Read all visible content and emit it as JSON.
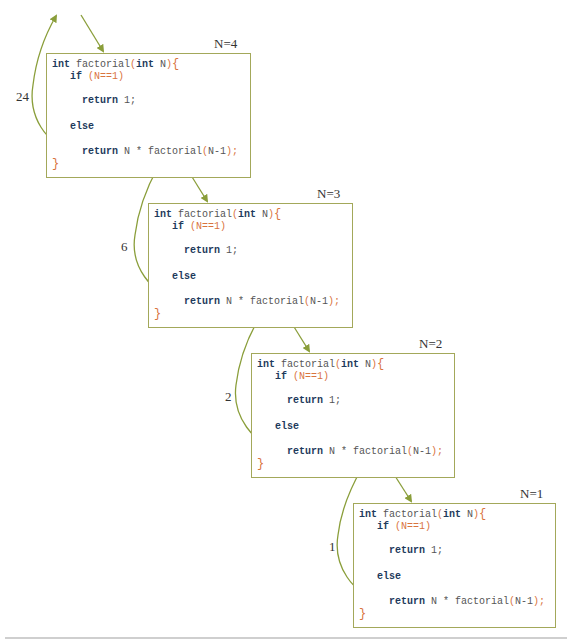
{
  "diagram": {
    "title": "",
    "frames": [
      {
        "label": "N=4",
        "return_value": "24",
        "code": {
          "kw_int1": "int",
          "fname": " factorial",
          "lp": "(",
          "kw_int2": "int",
          "param": " N",
          "rp": ")",
          "lbrace": "{",
          "kw_if": "if",
          "cond_open": " (",
          "cond": "N==1",
          "cond_close": ")",
          "kw_return1": "return",
          "ret1_val": " 1;",
          "kw_else": "else",
          "kw_return2": "return",
          "ret2_expr": " N * factorial",
          "call_open": "(",
          "call_arg": "N-1",
          "call_close": ")",
          "semi": ";",
          "rbrace": "}"
        }
      },
      {
        "label": "N=3",
        "return_value": "6",
        "code": {
          "kw_int1": "int",
          "fname": " factorial",
          "lp": "(",
          "kw_int2": "int",
          "param": " N",
          "rp": ")",
          "lbrace": "{",
          "kw_if": "if",
          "cond_open": " (",
          "cond": "N==1",
          "cond_close": ")",
          "kw_return1": "return",
          "ret1_val": " 1;",
          "kw_else": "else",
          "kw_return2": "return",
          "ret2_expr": " N * factorial",
          "call_open": "(",
          "call_arg": "N-1",
          "call_close": ")",
          "semi": ";",
          "rbrace": "}"
        }
      },
      {
        "label": "N=2",
        "return_value": "2",
        "code": {
          "kw_int1": "int",
          "fname": " factorial",
          "lp": "(",
          "kw_int2": "int",
          "param": " N",
          "rp": ")",
          "lbrace": "{",
          "kw_if": "if",
          "cond_open": " (",
          "cond": "N==1",
          "cond_close": ")",
          "kw_return1": "return",
          "ret1_val": " 1;",
          "kw_else": "else",
          "kw_return2": "return",
          "ret2_expr": " N * factorial",
          "call_open": "(",
          "call_arg": "N-1",
          "call_close": ")",
          "semi": ";",
          "rbrace": "}"
        }
      },
      {
        "label": "N=1",
        "return_value": "1",
        "code": {
          "kw_int1": "int",
          "fname": " factorial",
          "lp": "(",
          "kw_int2": "int",
          "param": " N",
          "rp": ")",
          "lbrace": "{",
          "kw_if": "if",
          "cond_open": " (",
          "cond": "N==1",
          "cond_close": ")",
          "kw_return1": "return",
          "ret1_val": " 1;",
          "kw_else": "else",
          "kw_return2": "return",
          "ret2_expr": " N * factorial",
          "call_open": "(",
          "call_arg": "N-1",
          "call_close": ")",
          "semi": ";",
          "rbrace": "}"
        }
      }
    ],
    "colors": {
      "frame_border": "#a3a85a",
      "arrow": "#8a9e3a",
      "keyword": "#1e3a5c",
      "punctuation": "#d9743e",
      "text": "#555555"
    }
  }
}
